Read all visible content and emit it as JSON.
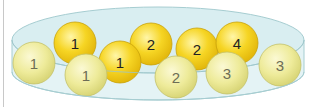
{
  "figure": {
    "colors": {
      "dish_fill": "#e2f2f4",
      "dish_stroke": "#9ec8cc",
      "back_ball": "#f5d21c",
      "front_ball": "#f0ec9c"
    },
    "back_balls": [
      {
        "label": "1",
        "cx": 75,
        "cy": 43
      },
      {
        "label": "2",
        "cx": 151,
        "cy": 44
      },
      {
        "label": "2",
        "cx": 197,
        "cy": 49
      },
      {
        "label": "4",
        "cx": 237,
        "cy": 43
      },
      {
        "label": "1",
        "cx": 120,
        "cy": 62
      }
    ],
    "front_balls": [
      {
        "label": "1",
        "cx": 34,
        "cy": 63
      },
      {
        "label": "1",
        "cx": 86,
        "cy": 75
      },
      {
        "label": "2",
        "cx": 176,
        "cy": 77
      },
      {
        "label": "3",
        "cx": 227,
        "cy": 73
      },
      {
        "label": "3",
        "cx": 280,
        "cy": 65
      }
    ]
  }
}
